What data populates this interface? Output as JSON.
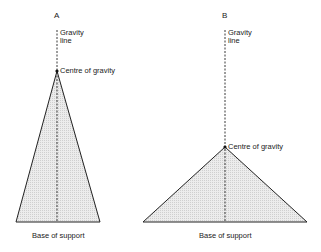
{
  "figures": [
    {
      "label": "A",
      "gravity_line_label": [
        "Gravity",
        "line"
      ],
      "centre_label": "Centre of gravity",
      "base_label": "Base of support",
      "apex": [
        57,
        71
      ],
      "base": [
        [
          16,
          222
        ],
        [
          100,
          222
        ]
      ]
    },
    {
      "label": "B",
      "gravity_line_label": [
        "Gravity",
        "line"
      ],
      "centre_label": "Centre of gravity",
      "base_label": "Base of support",
      "apex": [
        225,
        147
      ],
      "base": [
        [
          143,
          222
        ],
        [
          307,
          222
        ]
      ]
    }
  ],
  "colors": {
    "line": "#222222",
    "fill": "#e4e4e4"
  }
}
